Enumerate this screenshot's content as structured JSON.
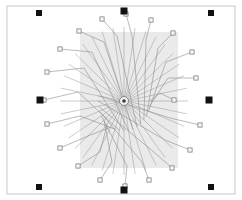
{
  "canvas": {
    "width": 242,
    "height": 200,
    "background_color": "#ffffff",
    "title": "Radial bond-wire layout diagram"
  },
  "frame": {
    "name": "outer-border",
    "x": 7,
    "y": 6,
    "width": 228,
    "height": 188,
    "stroke_color": "#c9c9c9",
    "stroke_width": 1,
    "fill": "none"
  },
  "shade_panel": {
    "name": "die-shade-rectangle",
    "x": 80,
    "y": 32,
    "width": 98,
    "height": 136,
    "fill_color": "#e3e3e3",
    "opacity": 0.75
  },
  "hub": {
    "name": "center-hub",
    "cx": 124,
    "cy": 101,
    "radius": 4.5,
    "core_radius": 1.8,
    "fill_color": "#f2f2f2",
    "stroke_color": "#555555",
    "core_color": "#3a3a3a"
  },
  "spokes": {
    "count": 36,
    "stroke_color": "#8e8e8e",
    "stroke_width": 0.45,
    "inner_radius": 5,
    "outer_radius_x": 64,
    "outer_radius_y": 74,
    "start_angle_deg": 0
  },
  "fiducials": {
    "stroke_color": "#111111",
    "fill_color": "#111111",
    "corner_size": 6,
    "edge_size": 7,
    "corners": [
      {
        "name": "fiducial-top-left",
        "cx": 39,
        "cy": 13,
        "size": 6
      },
      {
        "name": "fiducial-top-right",
        "cx": 211,
        "cy": 13,
        "size": 6
      },
      {
        "name": "fiducial-bottom-left",
        "cx": 39,
        "cy": 187,
        "size": 6
      },
      {
        "name": "fiducial-bottom-right",
        "cx": 211,
        "cy": 187,
        "size": 6
      }
    ],
    "edges": [
      {
        "name": "fiducial-top-center",
        "cx": 124,
        "cy": 11,
        "size": 7
      },
      {
        "name": "fiducial-bottom-center",
        "cx": 124,
        "cy": 190,
        "size": 7
      },
      {
        "name": "fiducial-left-center",
        "cx": 40,
        "cy": 100,
        "size": 7
      },
      {
        "name": "fiducial-right-center",
        "cx": 209,
        "cy": 100,
        "size": 7
      }
    ]
  },
  "pads": {
    "fill_color": "#f7f7f7",
    "stroke_color": "#6f6f6f",
    "size": 4.2,
    "lead_stroke_color": "#8c8c8c",
    "lead_stroke_width": 0.6,
    "items": [
      {
        "id": "pad-01",
        "x": 174,
        "y": 100,
        "bend_x": 160,
        "bend_y": 93,
        "anchor_angle_deg": 0
      },
      {
        "id": "pad-02",
        "x": 196,
        "y": 78,
        "bend_x": 168,
        "bend_y": 78,
        "anchor_angle_deg": 10
      },
      {
        "id": "pad-03",
        "x": 192,
        "y": 52,
        "bend_x": 166,
        "bend_y": 62,
        "anchor_angle_deg": 20
      },
      {
        "id": "pad-04",
        "x": 173,
        "y": 33,
        "bend_x": 158,
        "bend_y": 48,
        "anchor_angle_deg": 30
      },
      {
        "id": "pad-05",
        "x": 151,
        "y": 20,
        "bend_x": 146,
        "bend_y": 40,
        "anchor_angle_deg": 40
      },
      {
        "id": "pad-06",
        "x": 126,
        "y": 14,
        "bend_x": 132,
        "bend_y": 36,
        "anchor_angle_deg": 50
      },
      {
        "id": "pad-07",
        "x": 102,
        "y": 19,
        "bend_x": 117,
        "bend_y": 36,
        "anchor_angle_deg": 60
      },
      {
        "id": "pad-08",
        "x": 79,
        "y": 31,
        "bend_x": 104,
        "bend_y": 42,
        "anchor_angle_deg": 70
      },
      {
        "id": "pad-09",
        "x": 60,
        "y": 49,
        "bend_x": 92,
        "bend_y": 52,
        "anchor_angle_deg": 80
      },
      {
        "id": "pad-10",
        "x": 47,
        "y": 72,
        "bend_x": 84,
        "bend_y": 68,
        "anchor_angle_deg": 90
      },
      {
        "id": "pad-11",
        "x": 44,
        "y": 100,
        "bend_x": 78,
        "bend_y": 92,
        "anchor_angle_deg": 100
      },
      {
        "id": "pad-12",
        "x": 47,
        "y": 124,
        "bend_x": 80,
        "bend_y": 116,
        "anchor_angle_deg": 110
      },
      {
        "id": "pad-13",
        "x": 60,
        "y": 148,
        "bend_x": 88,
        "bend_y": 136,
        "anchor_angle_deg": 120
      },
      {
        "id": "pad-14",
        "x": 78,
        "y": 166,
        "bend_x": 100,
        "bend_y": 152,
        "anchor_angle_deg": 130
      },
      {
        "id": "pad-15",
        "x": 100,
        "y": 180,
        "bend_x": 112,
        "bend_y": 162,
        "anchor_angle_deg": 140
      },
      {
        "id": "pad-16",
        "x": 125,
        "y": 186,
        "bend_x": 127,
        "bend_y": 166,
        "anchor_angle_deg": 150
      },
      {
        "id": "pad-17",
        "x": 149,
        "y": 180,
        "bend_x": 142,
        "bend_y": 162,
        "anchor_angle_deg": 160
      },
      {
        "id": "pad-18",
        "x": 172,
        "y": 168,
        "bend_x": 155,
        "bend_y": 153,
        "anchor_angle_deg": 170
      },
      {
        "id": "pad-19",
        "x": 190,
        "y": 150,
        "bend_x": 165,
        "bend_y": 140,
        "anchor_angle_deg": 180
      },
      {
        "id": "pad-20",
        "x": 200,
        "y": 125,
        "bend_x": 170,
        "bend_y": 118,
        "anchor_angle_deg": 190
      }
    ]
  }
}
